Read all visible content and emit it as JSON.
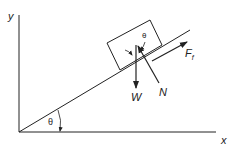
{
  "diagram": {
    "axes": {
      "x_label": "x",
      "y_label": "y"
    },
    "angle_label_incline": "θ",
    "angle_label_block": "θ",
    "forces": [
      {
        "name": "weight",
        "label": "W"
      },
      {
        "name": "normal",
        "label": "N"
      },
      {
        "name": "friction",
        "label": "F",
        "subscript": "f"
      }
    ],
    "colors": {
      "stroke": "#222222",
      "background": "#ffffff"
    }
  }
}
